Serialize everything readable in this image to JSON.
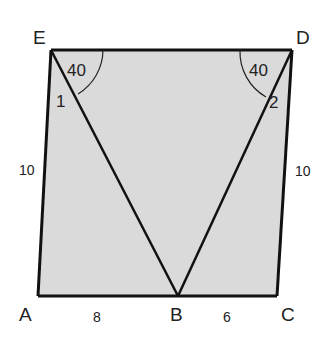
{
  "figure": {
    "vertices": {
      "A": "A",
      "B": "B",
      "C": "C",
      "D": "D",
      "E": "E"
    },
    "side_labels": {
      "EA": "10",
      "DC": "10",
      "AB": "8",
      "BC": "6"
    },
    "angle_labels": {
      "E_top": "40",
      "D_top": "40",
      "angle_1": "1",
      "angle_2": "2"
    },
    "colors": {
      "fill": "#d9d9d9",
      "stroke": "#111111"
    }
  }
}
